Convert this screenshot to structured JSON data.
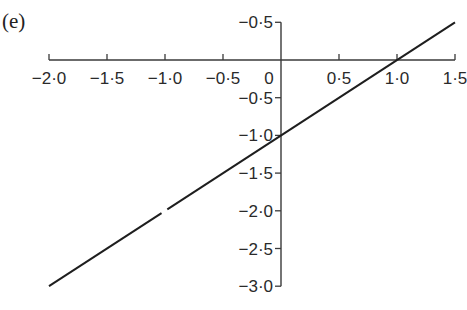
{
  "panel_label": "(e)",
  "chart_data": {
    "type": "line",
    "title": "",
    "panel": "(e)",
    "xlabel": "",
    "ylabel": "",
    "xlim": [
      -2.0,
      1.5
    ],
    "ylim": [
      -3.0,
      0.5
    ],
    "x_ticks": [
      -2.0,
      -1.5,
      -1.0,
      -0.5,
      0,
      0.5,
      1.0,
      1.5
    ],
    "x_tick_labels": [
      "−2·0",
      "−1·5",
      "−1·0",
      "−0·5",
      "0",
      "0·5",
      "1·0",
      "1·5"
    ],
    "y_ticks": [
      0.5,
      -0.5,
      -1.0,
      -1.5,
      -2.0,
      -2.5,
      -3.0
    ],
    "y_tick_labels": [
      "−0·5",
      "−0·5",
      "−1·0",
      "−1·5",
      "−2·0",
      "−2·5",
      "−3·0"
    ],
    "grid": false,
    "legend": null,
    "series": [
      {
        "name": "y = x − 1",
        "x": [
          -2.0,
          -1.5,
          -1.0,
          -0.5,
          0,
          0.5,
          1.0,
          1.5
        ],
        "y": [
          -3.0,
          -2.5,
          -2.0,
          -1.5,
          -1.0,
          -0.5,
          0.0,
          0.5
        ]
      }
    ],
    "annotations": [
      "Line crosses x-axis at x = 1.0 and y-axis at y = −1.0"
    ]
  }
}
